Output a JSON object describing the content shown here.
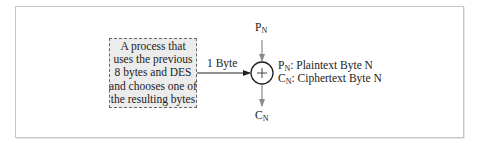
{
  "process_box": {
    "lines": [
      "A process that",
      "uses the previous",
      "8 bytes and DES",
      "and chooses one of",
      "the resulting bytes"
    ]
  },
  "arrow_label": "1 Byte",
  "xor_node": {
    "symbol": "+"
  },
  "input_label": {
    "main": "P",
    "sub": "N"
  },
  "output_label": {
    "main": "C",
    "sub": "N"
  },
  "legend": [
    {
      "main": "P",
      "sub": "N",
      "desc": ": Plaintext Byte N"
    },
    {
      "main": "C",
      "sub": "N",
      "desc": ": Ciphertext Byte N"
    }
  ],
  "colors": {
    "box_fill": "#ececec",
    "box_border": "#666666",
    "main_arrow": "#222222",
    "side_arrows": "#8a8a8a",
    "frame": "#c8c8c8"
  }
}
